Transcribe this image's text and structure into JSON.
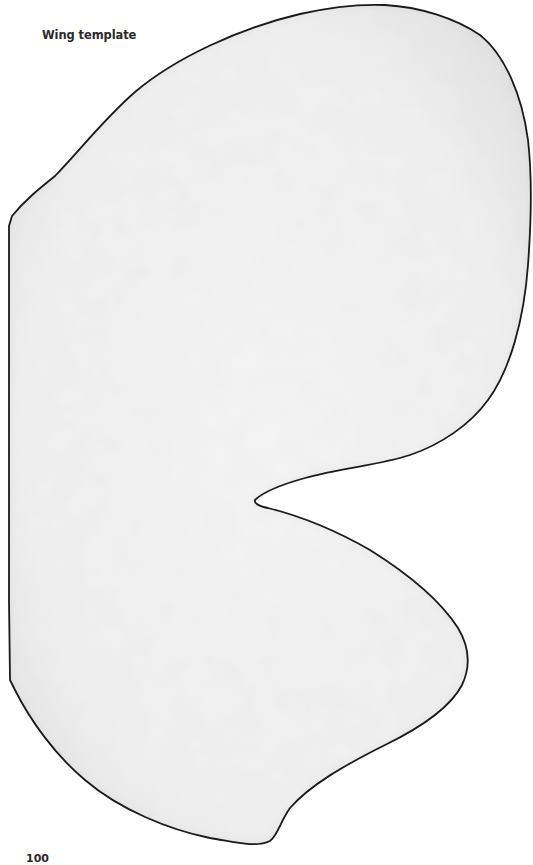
{
  "page": {
    "title": "Wing template",
    "page_number": "100"
  },
  "figure": {
    "name": "wing-template-shape",
    "stroke_color": "#1a1a1a",
    "fill_color": "#f3f3f3",
    "shadow_color": "#cfcfcf"
  }
}
